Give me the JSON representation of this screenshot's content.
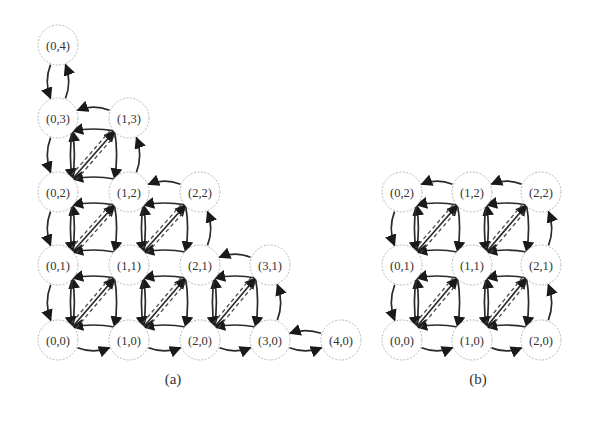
{
  "figure": {
    "panels": [
      {
        "id": "a",
        "caption": "(a)",
        "caption_pos": [
          173,
          384
        ],
        "nodes": [
          {
            "label": "(0,4)",
            "i": 0,
            "j": 4
          },
          {
            "label": "(0,3)",
            "i": 0,
            "j": 3
          },
          {
            "label": "(1,3)",
            "i": 1,
            "j": 3
          },
          {
            "label": "(0,2)",
            "i": 0,
            "j": 2
          },
          {
            "label": "(1,2)",
            "i": 1,
            "j": 2
          },
          {
            "label": "(2,2)",
            "i": 2,
            "j": 2
          },
          {
            "label": "(0,1)",
            "i": 0,
            "j": 1
          },
          {
            "label": "(1,1)",
            "i": 1,
            "j": 1
          },
          {
            "label": "(2,1)",
            "i": 2,
            "j": 1
          },
          {
            "label": "(3,1)",
            "i": 3,
            "j": 1
          },
          {
            "label": "(0,0)",
            "i": 0,
            "j": 0
          },
          {
            "label": "(1,0)",
            "i": 1,
            "j": 0
          },
          {
            "label": "(2,0)",
            "i": 2,
            "j": 0
          },
          {
            "label": "(3,0)",
            "i": 3,
            "j": 0
          },
          {
            "label": "(4,0)",
            "i": 4,
            "j": 0
          }
        ],
        "grid": {
          "x": [
            58,
            129,
            200,
            270,
            341
          ],
          "y": [
            340,
            265,
            192,
            118,
            45
          ]
        },
        "max_sum": 4
      },
      {
        "id": "b",
        "caption": "(b)",
        "caption_pos": [
          478,
          384
        ],
        "nodes": [
          {
            "label": "(0,2)",
            "i": 0,
            "j": 2
          },
          {
            "label": "(1,2)",
            "i": 1,
            "j": 2
          },
          {
            "label": "(2,2)",
            "i": 2,
            "j": 2
          },
          {
            "label": "(0,1)",
            "i": 0,
            "j": 1
          },
          {
            "label": "(1,1)",
            "i": 1,
            "j": 1
          },
          {
            "label": "(2,1)",
            "i": 2,
            "j": 1
          },
          {
            "label": "(0,0)",
            "i": 0,
            "j": 0
          },
          {
            "label": "(1,0)",
            "i": 1,
            "j": 0
          },
          {
            "label": "(2,0)",
            "i": 2,
            "j": 0
          }
        ],
        "grid": {
          "x": [
            402,
            472,
            541
          ],
          "y": [
            340,
            265,
            192
          ]
        },
        "max_index": 2
      }
    ],
    "node_radius": 20,
    "colors": {
      "edge": "#2a2a2a",
      "dashed_edge": "#4a4a4a",
      "node_border": "#b8b8b8",
      "label": "#333333"
    }
  }
}
